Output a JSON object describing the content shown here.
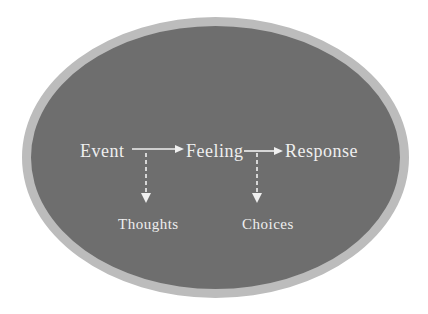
{
  "diagram": {
    "nodes": {
      "event": "Event",
      "feeling": "Feeling",
      "response": "Response",
      "thoughts": "Thoughts",
      "choices": "Choices"
    },
    "edges": [
      {
        "from": "Event",
        "to": "Feeling",
        "style": "solid",
        "direction": "right"
      },
      {
        "from": "Feeling",
        "to": "Response",
        "style": "solid",
        "direction": "right"
      },
      {
        "from": "Event-Feeling arrow",
        "to": "Thoughts",
        "style": "dashed",
        "direction": "down"
      },
      {
        "from": "Feeling-Response arrow",
        "to": "Choices",
        "style": "dashed",
        "direction": "down"
      }
    ],
    "colors": {
      "background": "#ffffff",
      "ellipse_fill": "#6e6e6e",
      "ellipse_border": "#bcbcbc",
      "text": "#efefef",
      "arrow": "#f0f0f0"
    }
  }
}
